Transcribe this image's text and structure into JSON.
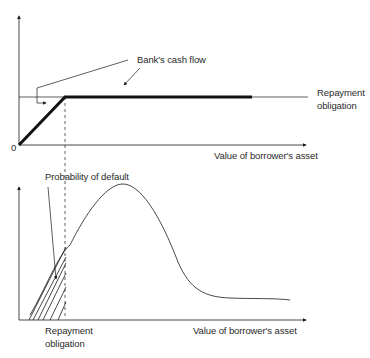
{
  "top_panel": {
    "origin_label": "0",
    "callout_label": "Bank's cash flow",
    "right_label_line1": "Repayment",
    "right_label_line2": "obligation",
    "x_axis_label": "Value of borrower's asset"
  },
  "bottom_panel": {
    "shaded_area_label": "Probability of default",
    "threshold_label_line1": "Repayment",
    "threshold_label_line2": "obligation",
    "x_axis_label": "Value of borrower's asset"
  },
  "colors": {
    "line": "#1a1a1a",
    "text": "#2a2a2a",
    "background": "#ffffff"
  }
}
